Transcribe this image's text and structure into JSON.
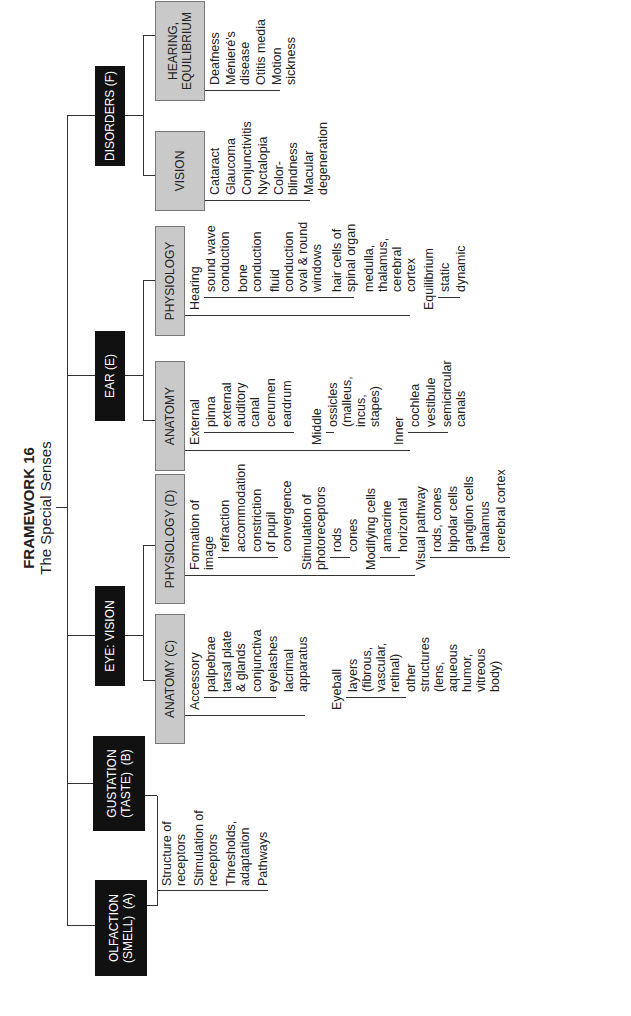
{
  "title": {
    "heading": "FRAMEWORK 16",
    "subtitle": "The Special Senses"
  },
  "colors": {
    "category_box": "#111111",
    "subcategory_box": "#c9c9c9",
    "lines": "#333333"
  },
  "categories": {
    "olfaction": {
      "label": "OLFACTION\n(SMELL)  (A)",
      "items": [
        "Structure of\nreceptors",
        "Stimulation of\nreceptors",
        "Thresholds,\nadaptation",
        "Pathways"
      ]
    },
    "gustation": {
      "label": "GUSTATION\n(TASTE)  (B)"
    },
    "eye": {
      "label": "EYE: VISION",
      "anatomy": {
        "label": "ANATOMY (C)",
        "accessory": {
          "label": "Accessory",
          "items": [
            "palpebrae",
            "tarsal plate\n& glands",
            "conjunctiva",
            "eyelashes",
            "lacrimal\napparatus"
          ]
        },
        "eyeball": {
          "label": "Eyeball",
          "items": [
            "layers\n(fibrous,\nvascular,\nretinal)",
            "other\nstructures\n(lens,\naqueous\nhumor,\nvitreous\nbody)"
          ]
        }
      },
      "physiology": {
        "label": "PHYSIOLOGY (D)",
        "image": {
          "label": "Formation of\nimage",
          "items": [
            "refraction",
            "accommodation",
            "constriction\nof pupil",
            "convergence"
          ]
        },
        "photoreceptors": {
          "label": "Stimulation of\nphotoreceptors",
          "items": [
            "rods",
            "cones"
          ]
        },
        "modifying": {
          "label": "Modifying cells",
          "items": [
            "amacrine",
            "horizontal"
          ]
        },
        "visual_pathway": {
          "label": "Visual pathway",
          "items": [
            "rods, cones",
            "bipolar cells",
            "ganglion cells",
            "thalamus",
            "cerebral cortex"
          ]
        }
      }
    },
    "ear": {
      "label": "EAR (E)",
      "anatomy": {
        "label": "ANATOMY",
        "external": {
          "label": "External",
          "items": [
            "pinna",
            "external\nauditory\ncanal",
            "cerumen",
            "eardrum"
          ]
        },
        "middle": {
          "label": "Middle",
          "items": [
            "ossicles\n(malleus,\nincus,\nstapes)"
          ]
        },
        "inner": {
          "label": "Inner",
          "items": [
            "cochlea",
            "vestibule",
            "semicircular\ncanals"
          ]
        }
      },
      "physiology": {
        "label": "PHYSIOLOGY",
        "hearing": {
          "label": "Hearing",
          "items": [
            "sound wave\nconduction",
            "bone\nconduction",
            "fluid\nconduction\noval & round\nwindows",
            "hair cells of\nspinal organ",
            "medulla,\nthalamus,\ncerebral\ncortex"
          ]
        },
        "equilibrium": {
          "label": "Equilibrium",
          "items": [
            "static",
            "dynamic"
          ]
        }
      }
    },
    "disorders": {
      "label": "DISORDERS (F)",
      "vision": {
        "label": "VISION",
        "items": [
          "Cataract",
          "Glaucoma",
          "Conjunctivitis",
          "Nyctalopia",
          "Color-\nblindness",
          "Macular\ndegeneration"
        ]
      },
      "hearing": {
        "label": "HEARING,\nEQUILIBRIUM",
        "items": [
          "Deafness",
          "Ménieré's\ndisease",
          "Otitis media",
          "Motion\nsickness"
        ]
      }
    }
  }
}
